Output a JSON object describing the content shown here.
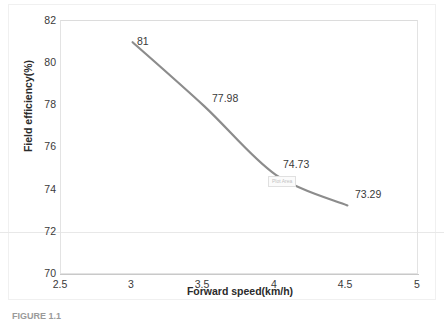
{
  "chart_data": {
    "type": "line",
    "title": "",
    "xlabel": "Forward speed(km/h)",
    "ylabel": "Field efficiency(%)",
    "x": [
      3,
      3.5,
      4,
      4.5
    ],
    "values": [
      81,
      77.98,
      74.73,
      73.29
    ],
    "point_labels": [
      "81",
      "77.98",
      "74.73",
      "73.29"
    ],
    "xlim": [
      2.5,
      5
    ],
    "ylim": [
      70,
      82
    ],
    "xticks": [
      "2.5",
      "3",
      "3.5",
      "4",
      "4.5",
      "5"
    ],
    "yticks": [
      "70",
      "72",
      "74",
      "76",
      "78",
      "80",
      "82"
    ],
    "grid": false,
    "legend": "none",
    "series_color": "#8c8c8c"
  },
  "annotations": {
    "plot_area_tooltip": "Plot Area"
  },
  "caption": {
    "text": "FIGURE 1.1"
  }
}
